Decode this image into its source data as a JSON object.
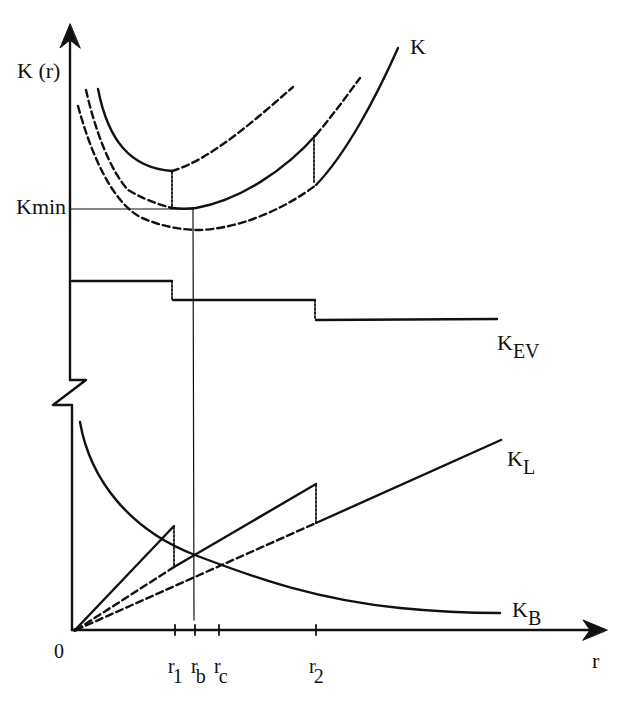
{
  "diagram": {
    "type": "cost-vs-radius schematic",
    "axes": {
      "y_label": "K (r)",
      "x_label": "r",
      "origin_label": "0",
      "y_axis_break": true
    },
    "y_markers": {
      "kmin_label": "Kmin"
    },
    "x_ticks": [
      {
        "main": "r",
        "sub": "1",
        "x": 175
      },
      {
        "main": "r",
        "sub": "b",
        "x": 195
      },
      {
        "main": "r",
        "sub": "c",
        "x": 219
      },
      {
        "main": "r",
        "sub": "2",
        "x": 316
      }
    ],
    "curve_labels": {
      "total": {
        "main": "K",
        "sub": ""
      },
      "ev": {
        "main": "K",
        "sub": "EV"
      },
      "line": {
        "main": "K",
        "sub": "L"
      },
      "base": {
        "main": "K",
        "sub": "B"
      }
    },
    "colors": {
      "ink": "#111111",
      "background": "#ffffff"
    }
  }
}
